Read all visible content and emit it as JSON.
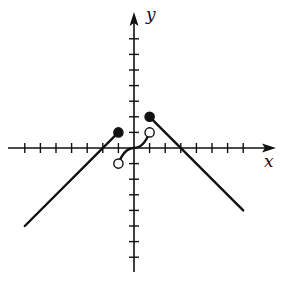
{
  "chart_data": {
    "type": "line",
    "title": "",
    "xlabel": "x",
    "ylabel": "y",
    "xlim": [
      -7,
      8
    ],
    "ylim": [
      -8,
      8
    ],
    "grid": false,
    "x_ticks": [
      -7,
      -6,
      -5,
      -4,
      -3,
      -2,
      -1,
      1,
      2,
      3,
      4,
      5,
      6,
      7
    ],
    "y_ticks": [
      -7,
      -6,
      -5,
      -4,
      -3,
      -2,
      -1,
      1,
      2,
      3,
      4,
      5,
      6,
      7
    ],
    "tick_labels_shown": false,
    "series": [
      {
        "name": "left-piece",
        "kind": "linear",
        "points": [
          [
            -7,
            -5
          ],
          [
            -1,
            1
          ]
        ],
        "endpoints": {
          "right": {
            "x": -1,
            "y": 1,
            "style": "closed"
          }
        }
      },
      {
        "name": "middle-piece",
        "kind": "cubic-like curve",
        "points": [
          [
            -1,
            -1
          ],
          [
            -0.5,
            -0.2
          ],
          [
            0,
            0
          ],
          [
            0.5,
            0.2
          ],
          [
            1,
            1
          ]
        ],
        "endpoints": {
          "left": {
            "x": -1,
            "y": -1,
            "style": "open"
          },
          "right": {
            "x": 1,
            "y": 1,
            "style": "open"
          }
        }
      },
      {
        "name": "right-piece",
        "kind": "linear",
        "points": [
          [
            1,
            2
          ],
          [
            7,
            -4
          ]
        ],
        "endpoints": {
          "left": {
            "x": 1,
            "y": 2,
            "style": "closed"
          }
        }
      }
    ],
    "annotations": []
  },
  "labels": {
    "x_axis": "x",
    "y_axis": "y"
  },
  "colors": {
    "ink": "#111111",
    "background": "#ffffff"
  }
}
